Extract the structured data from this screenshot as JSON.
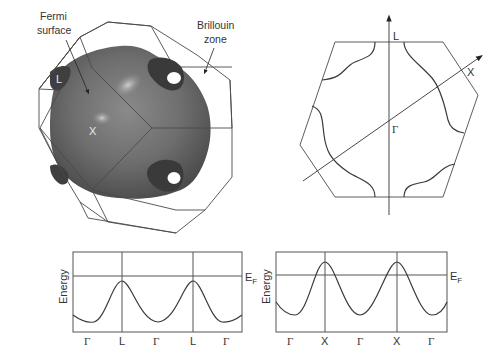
{
  "figure": {
    "panel_3d": {
      "label_fermi_line1": "Fermi",
      "label_fermi_line2": "surface",
      "label_bz_line1": "Brillouin",
      "label_bz_line2": "zone",
      "point_x": "X",
      "point_l": "L",
      "surface_color": "#6b6b6b"
    },
    "panel_cross_section": {
      "axis_l": "L",
      "axis_x": "X",
      "center": "Γ"
    },
    "band_plot_left": {
      "ylabel": "Energy",
      "fermi_label": "E",
      "fermi_sub": "F",
      "ticks": [
        "Γ",
        "L",
        "Γ",
        "L",
        "Γ"
      ]
    },
    "band_plot_right": {
      "ylabel": "Energy",
      "fermi_label": "E",
      "fermi_sub": "F",
      "ticks": [
        "Γ",
        "X",
        "Γ",
        "X",
        "Γ"
      ]
    }
  }
}
